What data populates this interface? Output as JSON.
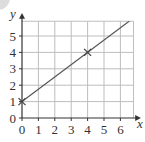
{
  "chart_data": {
    "type": "line",
    "title": "",
    "xlabel": "x",
    "ylabel": "y",
    "xlim": [
      0,
      6.8
    ],
    "ylim": [
      0,
      5.9
    ],
    "grid": true,
    "x_ticks": [
      "0",
      "1",
      "2",
      "3",
      "4",
      "5",
      "6"
    ],
    "y_ticks": [
      "0",
      "1",
      "2",
      "3",
      "4",
      "5"
    ],
    "series": [
      {
        "name": "line",
        "x": [
          0,
          6.8
        ],
        "y": [
          1,
          6.1
        ],
        "equation": "y = 0.75x + 1",
        "color": "#555555"
      }
    ],
    "marked_points": [
      {
        "x": 0,
        "y": 1,
        "marker": "cross"
      },
      {
        "x": 4,
        "y": 4,
        "marker": "cross"
      }
    ],
    "legend": null
  },
  "colors": {
    "grid": "#bdbdbd",
    "axis": "#333333",
    "line": "#555555",
    "corner_artifact": "#d9d9d9"
  }
}
